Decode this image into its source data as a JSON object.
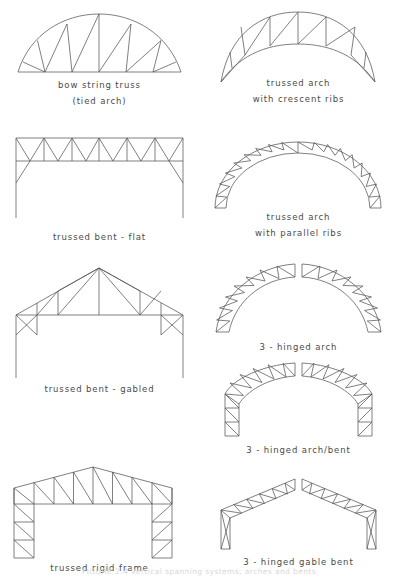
{
  "page": {
    "background": "#ffffff",
    "line_color": "#555555",
    "text_color": "#4a4a4a"
  },
  "figures": [
    {
      "id": "bow-string-truss",
      "caption_line1": "bow string truss",
      "caption_line2": "(tied arch)",
      "type": "bowstring truss with tie rod, W web pattern"
    },
    {
      "id": "trussed-arch-crescent-ribs",
      "caption_line1": "trussed arch",
      "caption_line2": "with crescent ribs",
      "type": "two-arc crescent arch meeting at springings, triangulated web"
    },
    {
      "id": "trussed-bent-flat",
      "caption_line1": "trussed bent - flat",
      "caption_line2": "",
      "type": "parallel chord flat truss on columns with knee braces"
    },
    {
      "id": "trussed-arch-parallel-ribs",
      "caption_line1": "trussed arch",
      "caption_line2": "with parallel ribs",
      "type": "semicircular constant-depth arched truss"
    },
    {
      "id": "trussed-bent-gabled",
      "caption_line1": "trussed bent - gabled",
      "caption_line2": "",
      "type": "fan / fink gabled truss on columns with knee braces"
    },
    {
      "id": "three-hinged-arch",
      "caption_line1": "3 - hinged arch",
      "caption_line2": "",
      "type": "two trussed arch halves hinged at crown and supports"
    },
    {
      "id": "three-hinged-arch-bent",
      "caption_line1": "3 - hinged arch/bent",
      "caption_line2": "",
      "type": "three hinged arch with vertical leg ends"
    },
    {
      "id": "trussed-rigid-frame",
      "caption_line1": "trussed rigid frame",
      "caption_line2": "",
      "type": "gabled trussed rigid frame with trussed legs"
    },
    {
      "id": "three-hinged-gable-bent",
      "caption_line1": "3 - hinged gable bent",
      "caption_line2": "",
      "type": "gabled three hinged bent with tapered trussed rafters"
    }
  ],
  "footer": {
    "note": "FIGURE 2.4  Vertical spanning systems; arches and bents"
  }
}
